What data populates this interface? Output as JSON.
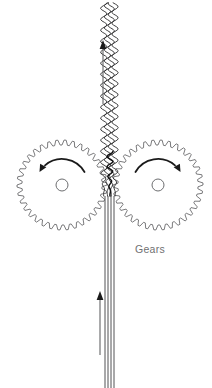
{
  "figure": {
    "title": "Gears",
    "background_color": "#ffffff",
    "width": 212,
    "height": 388
  },
  "labels": {
    "gears": "Gears"
  },
  "colors": {
    "gear_outline": "#58585a",
    "gear_hub": "#6d6e70",
    "rotation_arrow": "#1a1a1a",
    "strand": "#3f4042",
    "crimped_strand": "#2b2b2d",
    "flow_arrow": "#636466",
    "caption": "#6f7072",
    "background": "#ffffff"
  },
  "gears": [
    {
      "name": "left-gear",
      "center_x": 62,
      "center_y": 185,
      "outer_radius": 45,
      "root_radius": 40,
      "teeth": 34,
      "hub_radius": 6,
      "rotation": "counterclockwise",
      "arrow_direction": "left"
    },
    {
      "name": "right-gear",
      "center_x": 158,
      "center_y": 185,
      "outer_radius": 45,
      "root_radius": 40,
      "teeth": 34,
      "hub_radius": 6,
      "rotation": "clockwise",
      "arrow_direction": "right"
    }
  ],
  "nip": {
    "x": 110,
    "y": 185
  },
  "strands": {
    "count": 4,
    "straight_x_offsets": [
      -5,
      -2,
      1,
      4
    ],
    "straight_bottom_y": 388,
    "straight_top_y": 196,
    "crimped_bottom_y": 196,
    "crimped_top_y": 2,
    "wave_amplitude": 3.2,
    "wave_period": 11,
    "state_below": "straight filaments",
    "state_above": "crimped filaments"
  },
  "flow_arrows": [
    {
      "name": "inlet-flow-arrow",
      "x": 100,
      "tail_y": 355,
      "head_y": 291,
      "direction": "up"
    },
    {
      "name": "outlet-flow-arrow",
      "x": 103,
      "tail_y": 104,
      "head_y": 40,
      "direction": "up"
    }
  ],
  "caption": {
    "text": "Gears",
    "x": 150,
    "y": 253
  }
}
